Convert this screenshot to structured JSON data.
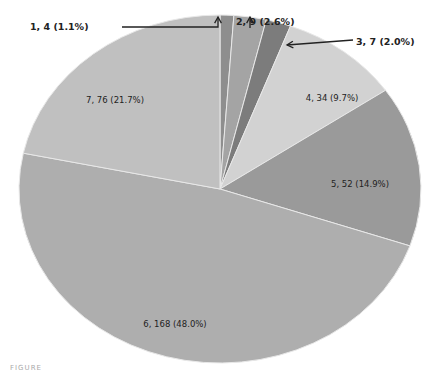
{
  "chart_data": {
    "type": "pie",
    "title": "",
    "start_angle_deg": 0,
    "direction": "clockwise",
    "slices": [
      {
        "label": "1",
        "value": 4,
        "percent": 1.1,
        "text": "1, 4 (1.1%)",
        "color": "#8e8e8e",
        "label_outside": true
      },
      {
        "label": "2",
        "value": 9,
        "percent": 2.6,
        "text": "2, 9 (2.6%)",
        "color": "#a4a4a4",
        "label_outside": true
      },
      {
        "label": "3",
        "value": 7,
        "percent": 2.0,
        "text": "3, 7 (2.0%)",
        "color": "#7c7c7c",
        "label_outside": true
      },
      {
        "label": "4",
        "value": 34,
        "percent": 9.7,
        "text": "4, 34 (9.7%)",
        "color": "#d2d2d2",
        "label_outside": false
      },
      {
        "label": "5",
        "value": 52,
        "percent": 14.9,
        "text": "5, 52 (14.9%)",
        "color": "#9a9a9a",
        "label_outside": false
      },
      {
        "label": "6",
        "value": 168,
        "percent": 48.0,
        "text": "6, 168 (48.0%)",
        "color": "#aeaeae",
        "label_outside": false
      },
      {
        "label": "7",
        "value": 76,
        "percent": 21.7,
        "text": "7, 76 (21.7%)",
        "color": "#c0c0c0",
        "label_outside": false
      }
    ],
    "legend": "none",
    "grid": false
  },
  "layout": {
    "cx": 220,
    "cy": 189,
    "rx": 201,
    "ry": 174,
    "slice_border": "#e8e8e8",
    "label_positions": [
      {
        "x": 30,
        "y": 30,
        "anchor": "start",
        "arrow": [
          [
            122,
            27
          ],
          [
            218,
            27
          ],
          [
            218,
            17
          ]
        ],
        "arrow_head": [
          218,
          17
        ]
      },
      {
        "x": 236,
        "y": 25,
        "anchor": "start",
        "arrow": [
          [
            250,
            28
          ],
          [
            250,
            17
          ]
        ],
        "arrow_head": [
          250,
          17
        ]
      },
      {
        "x": 356,
        "y": 45,
        "anchor": "start",
        "arrow": [
          [
            353,
            40
          ],
          [
            287,
            45
          ]
        ],
        "arrow_head": [
          287,
          45
        ]
      },
      {
        "x": 332,
        "y": 101,
        "anchor": "middle"
      },
      {
        "x": 360,
        "y": 187,
        "anchor": "middle"
      },
      {
        "x": 175,
        "y": 327,
        "anchor": "middle"
      },
      {
        "x": 115,
        "y": 103,
        "anchor": "middle"
      }
    ]
  },
  "caption": {
    "text": "FIGURE"
  }
}
